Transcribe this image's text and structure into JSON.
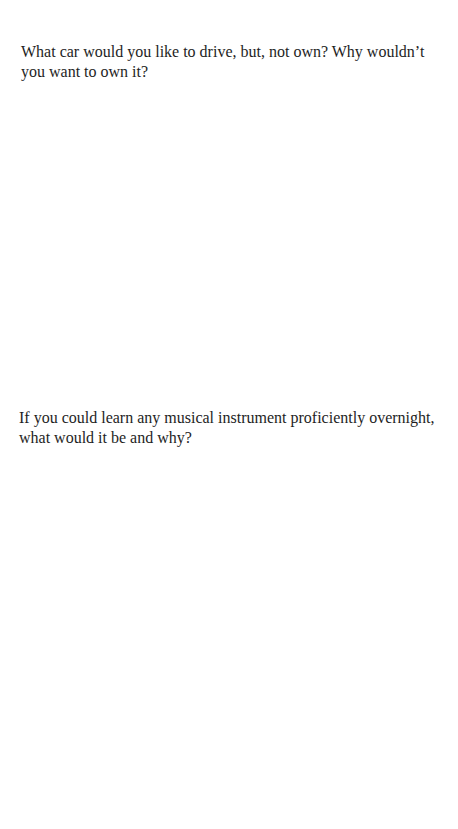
{
  "document": {
    "questions": [
      {
        "text": "What car would you like to drive, but, not own? Why wouldn’t you want to own it?"
      },
      {
        "text": "If you could learn any musical instrument proficiently overnight, what would it be and why?"
      }
    ]
  }
}
